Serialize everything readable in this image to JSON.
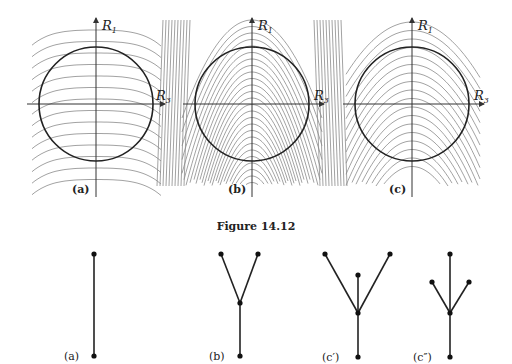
{
  "figure": {
    "caption": "Figure 14.12",
    "axis_labels": {
      "vertical": "R",
      "vertical_sub": "1",
      "horizontal": "R",
      "horizontal_sub": "3"
    },
    "panels": [
      {
        "id": "a",
        "label": "(a)",
        "description": "level curves bending downward (horizontal-ish arcs) over circle"
      },
      {
        "id": "b",
        "label": "(b)",
        "description": "nested parabola-like curves opening downward, dense at sides"
      },
      {
        "id": "c",
        "label": "(c)",
        "description": "nested arcs opening downward, intermediate case"
      }
    ]
  },
  "trees": [
    {
      "id": "a",
      "label": "(a)"
    },
    {
      "id": "b",
      "label": "(b)"
    },
    {
      "id": "c1",
      "label": "(c′)"
    },
    {
      "id": "c2",
      "label": "(c″)"
    }
  ],
  "colors": {
    "ink": "#222222",
    "level_curve": "#8a8a8a",
    "background": "#ffffff"
  }
}
